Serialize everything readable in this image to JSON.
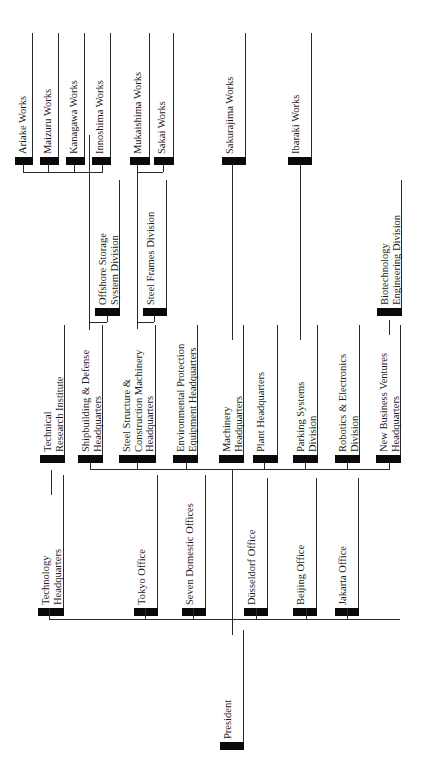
{
  "chart_data": {
    "type": "org-chart",
    "orientation": "rotated -90deg (reads bottom-to-top)",
    "root": "President",
    "groups": [
      {
        "name": "Corporate Offices",
        "units": [
          "Technology Headquarters",
          "Tokyo Office",
          "Seven Domestic Offices",
          "Düsseldorf Office",
          "Beijing Office",
          "Jakarta Office"
        ]
      },
      {
        "name": "Headquarters & Divisions",
        "units": [
          {
            "name": "Technical Research Institute",
            "children": []
          },
          {
            "name": "Shipbuilding & Defense Headquarters",
            "children": [
              "Offshore Storage System Division",
              "Ariake Works",
              "Maizuru Works",
              "Kanagawa Works",
              "Innoshima Works"
            ]
          },
          {
            "name": "Steel Structure & Construction Machinery Headquarters",
            "children": [
              "Steel Frames Division",
              "Mukaishima Works",
              "Sakai Works"
            ]
          },
          {
            "name": "Environmental Protection Equipment Headquarters",
            "children": []
          },
          {
            "name": "Machinery Headquarters",
            "children": [
              "Sakurajima Works"
            ]
          },
          {
            "name": "Plant Headquarters",
            "children": []
          },
          {
            "name": "Parking Systems Division",
            "children": [
              "Ibaraki Works"
            ]
          },
          {
            "name": "Robotics & Electronics Division",
            "children": []
          },
          {
            "name": "New Business Ventures Headquarters",
            "children": [
              "Biotechnology Engineering Division"
            ]
          }
        ]
      }
    ]
  },
  "nodes": {
    "president": [
      "President"
    ],
    "technology_hq": [
      "Technology",
      "Headquarters"
    ],
    "tokyo": [
      "Tokyo Office"
    ],
    "seven_domestic": [
      "Seven Domestic Offices"
    ],
    "dusseldorf": [
      "Düsseldorf Office"
    ],
    "beijing": [
      "Beijing Office"
    ],
    "jakarta": [
      "Jakarta Office"
    ],
    "tech_research": [
      "Technical",
      "Research Institute"
    ],
    "shipbuilding": [
      "Shipbuilding & Defense",
      "Headquarters"
    ],
    "steel_structure": [
      "Steel Structure &",
      "Construction Machinery",
      "Headquarters"
    ],
    "env_protection": [
      "Environmental Protection",
      "Equipment Headquarters"
    ],
    "machinery": [
      "Machinery",
      "Headquarters"
    ],
    "plant": [
      "Plant Headquarters"
    ],
    "parking": [
      "Parking Systems",
      "Division"
    ],
    "robotics": [
      "Robotics & Electronics",
      "Division"
    ],
    "new_business": [
      "New Business Ventures",
      "Headquarters"
    ],
    "offshore": [
      "Offshore Storage",
      "System Division"
    ],
    "steel_frames": [
      "Steel Frames Division"
    ],
    "biotech": [
      "Biotechnology",
      "Engineering Division"
    ],
    "ariake": [
      "Ariake Works"
    ],
    "maizuru": [
      "Maizuru Works"
    ],
    "kanagawa": [
      "Kanagawa Works"
    ],
    "innoshima": [
      "Innoshima Works"
    ],
    "mukaishima": [
      "Mukaishima Works"
    ],
    "sakai": [
      "Sakai Works"
    ],
    "sakurajima": [
      "Sakurajima Works"
    ],
    "ibaraki": [
      "Ibaraki Works"
    ]
  }
}
